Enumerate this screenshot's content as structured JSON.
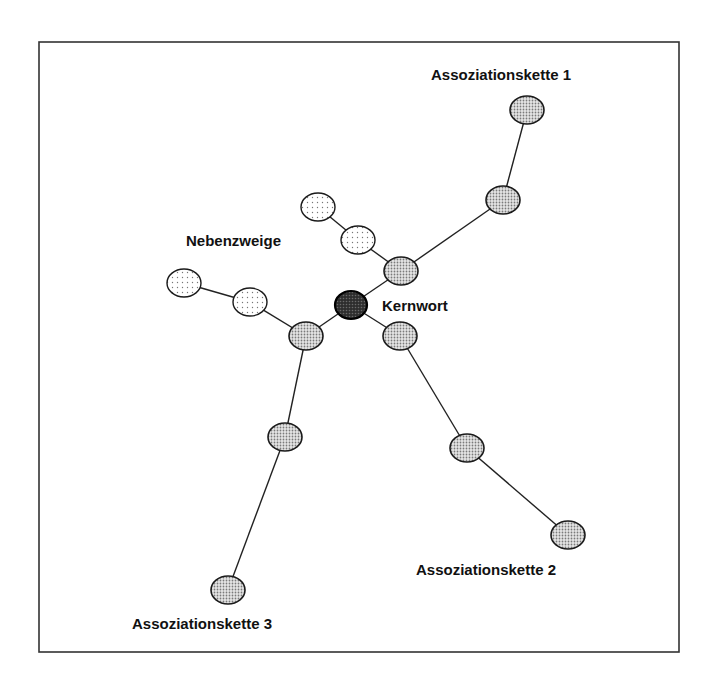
{
  "diagram": {
    "frame": {
      "x": 39,
      "y": 42,
      "width": 640,
      "height": 610
    },
    "colors": {
      "background": "#ffffff",
      "stroke": "#1a1a1a",
      "chain_fill": "#c8c8c8",
      "side_fill": "#f2f2f2",
      "core_fill": "#3a3a3a"
    },
    "labels": {
      "core": "Kernwort",
      "side_branches": "Nebenzweige",
      "chain1": "Assoziationskette 1",
      "chain2": "Assoziationskette 2",
      "chain3": "Assoziationskette 3"
    },
    "core_node": {
      "id": "core",
      "x": 351,
      "y": 305
    },
    "chains": [
      {
        "name": "Assoziationskette 1",
        "nodes": [
          {
            "id": "c1n1",
            "x": 401,
            "y": 271
          },
          {
            "id": "c1n2",
            "x": 503,
            "y": 200
          },
          {
            "id": "c1n3",
            "x": 527,
            "y": 110
          }
        ]
      },
      {
        "name": "Assoziationskette 2",
        "nodes": [
          {
            "id": "c2n1",
            "x": 400,
            "y": 336
          },
          {
            "id": "c2n2",
            "x": 467,
            "y": 448
          },
          {
            "id": "c2n3",
            "x": 568,
            "y": 535
          }
        ]
      },
      {
        "name": "Assoziationskette 3",
        "nodes": [
          {
            "id": "c3n1",
            "x": 306,
            "y": 336
          },
          {
            "id": "c3n2",
            "x": 285,
            "y": 437
          },
          {
            "id": "c3n3",
            "x": 228,
            "y": 590
          }
        ]
      }
    ],
    "side_branches": [
      {
        "attached_to": "c1n1",
        "nodes": [
          {
            "id": "s1n1",
            "x": 358,
            "y": 240
          },
          {
            "id": "s1n2",
            "x": 318,
            "y": 207
          }
        ]
      },
      {
        "attached_to": "c3n1",
        "nodes": [
          {
            "id": "s2n1",
            "x": 250,
            "y": 302
          },
          {
            "id": "s2n2",
            "x": 184,
            "y": 283
          }
        ]
      }
    ]
  }
}
